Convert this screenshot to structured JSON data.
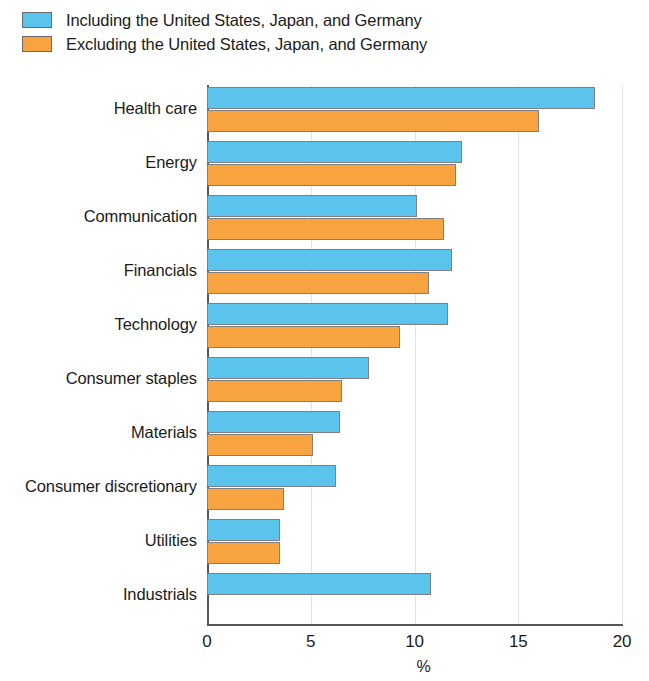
{
  "legend": {
    "items": [
      {
        "label": "Including the United States, Japan, and Germany",
        "color": "#5bc4ec",
        "name": "including"
      },
      {
        "label": "Excluding the United States, Japan, and Germany",
        "color": "#f7a440",
        "name": "excluding"
      }
    ]
  },
  "axis": {
    "x_title": "%",
    "ticks": [
      "0",
      "5",
      "10",
      "15",
      "20"
    ]
  },
  "chart_data": {
    "type": "bar",
    "orientation": "horizontal",
    "title": "",
    "xlabel": "%",
    "ylabel": "",
    "xlim": [
      0,
      20
    ],
    "xticks": [
      0,
      5,
      10,
      15,
      20
    ],
    "grid": true,
    "legend_position": "top-left",
    "categories": [
      "Health care",
      "Energy",
      "Communication",
      "Financials",
      "Technology",
      "Consumer staples",
      "Materials",
      "Consumer discretionary",
      "Utilities",
      "Industrials"
    ],
    "series": [
      {
        "name": "Including the United States, Japan, and Germany",
        "color": "#5bc4ec",
        "values": [
          18.7,
          12.3,
          10.1,
          11.8,
          11.6,
          7.8,
          6.4,
          6.2,
          3.5,
          10.8
        ]
      },
      {
        "name": "Excluding the United States, Japan, and Germany",
        "color": "#f7a440",
        "values": [
          16.0,
          12.0,
          11.4,
          10.7,
          9.3,
          6.5,
          5.1,
          3.7,
          3.5,
          null
        ]
      }
    ]
  }
}
